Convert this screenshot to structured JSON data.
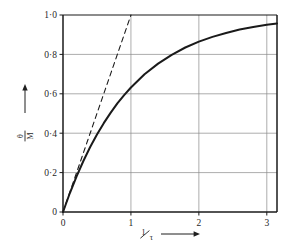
{
  "chart_data": {
    "type": "line",
    "title": "",
    "subtitle": "",
    "xlabel": "1/τ",
    "ylabel": "θ/M",
    "ylabel_numerator": "θ",
    "ylabel_denominator": "M",
    "xlabel_numerator": "1",
    "xlabel_denominator": "τ",
    "xlim": [
      0,
      3.15
    ],
    "ylim": [
      0,
      1.0
    ],
    "grid": true,
    "grid_color": "#8a8a8a",
    "frame_color": "#1a1a1a",
    "legend": "none",
    "x_ticks": [
      0,
      1,
      2,
      3
    ],
    "x_tick_labels": [
      "0",
      "1",
      "2",
      "3"
    ],
    "y_ticks": [
      0,
      0.2,
      0.4,
      0.6,
      0.8,
      1.0
    ],
    "y_tick_labels": [
      "0",
      "0·2",
      "0·4",
      "0·6",
      "0·8",
      "1·0"
    ],
    "series": [
      {
        "name": "exponential-rise",
        "style": "solid",
        "color": "#1a1a1a",
        "width": 2.0,
        "equation": "1 - exp(-x)",
        "x": [
          0,
          0.1,
          0.2,
          0.3,
          0.4,
          0.5,
          0.6,
          0.7,
          0.8,
          0.9,
          1.0,
          1.2,
          1.4,
          1.6,
          1.8,
          2.0,
          2.2,
          2.4,
          2.6,
          2.8,
          3.0,
          3.15
        ],
        "values": [
          0.0,
          0.095,
          0.181,
          0.259,
          0.33,
          0.393,
          0.451,
          0.503,
          0.551,
          0.593,
          0.632,
          0.699,
          0.753,
          0.798,
          0.835,
          0.865,
          0.889,
          0.909,
          0.926,
          0.939,
          0.95,
          0.957
        ]
      },
      {
        "name": "initial-tangent",
        "style": "dashed",
        "color": "#1a1a1a",
        "width": 1.1,
        "equation": "x",
        "x": [
          0,
          1.0
        ],
        "values": [
          0.0,
          1.0
        ]
      }
    ],
    "annotations": [
      {
        "name": "y-axis-arrow",
        "kind": "up-arrow",
        "at": "y-axis-label"
      },
      {
        "name": "x-axis-arrow",
        "kind": "right-arrow",
        "at": "x-axis-label"
      }
    ]
  },
  "axes": {
    "y_title_arrow": "↑",
    "x_title_arrow": "→"
  }
}
